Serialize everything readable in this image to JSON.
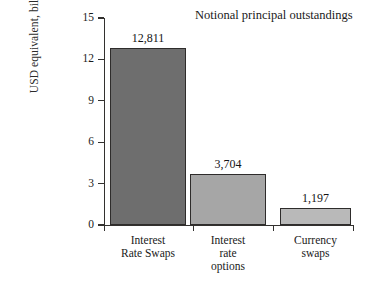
{
  "chart_data": {
    "type": "bar",
    "title": "Notional principal outstandings",
    "xlabel": "",
    "ylabel": "USD equivalent, billions",
    "categories": [
      "Interest Rate Swaps",
      "Interest rate options",
      "Currency swaps"
    ],
    "category_lines": [
      [
        "Interest",
        "Rate Swaps"
      ],
      [
        "Interest",
        "rate",
        "options"
      ],
      [
        "Currency",
        "swaps"
      ]
    ],
    "values": [
      12811,
      3704,
      1197
    ],
    "value_labels": [
      "12,811",
      "3,704",
      "1,197"
    ],
    "plotted_values": [
      12.811,
      3.704,
      1.197
    ],
    "ylim": [
      0,
      15
    ],
    "yticks": [
      0,
      3,
      6,
      9,
      12,
      15
    ],
    "ytick_labels": [
      "0",
      "3",
      "6",
      "9",
      "12",
      "15"
    ],
    "grid": false,
    "legend": false,
    "bar_colors": [
      "#6e6e6e",
      "#a6a6a6",
      "#b9b9b9"
    ],
    "bar_border_color": "#2e2c2b",
    "axis_color": "#33312f",
    "background": "#ffffff"
  }
}
